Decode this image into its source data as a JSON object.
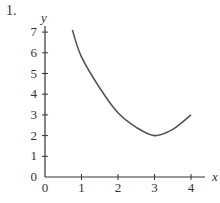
{
  "problem_number": "1.",
  "chart_data": {
    "type": "line",
    "title": "",
    "xlabel": "x",
    "ylabel": "y",
    "xlim": [
      0,
      4
    ],
    "ylim": [
      0,
      7
    ],
    "x_ticks": [
      0,
      1,
      2,
      3,
      4
    ],
    "y_ticks": [
      0,
      1,
      2,
      3,
      4,
      5,
      6,
      7
    ],
    "grid": false,
    "legend": null,
    "series": [
      {
        "name": "curve",
        "x": [
          0.75,
          1,
          1.5,
          2,
          2.5,
          3,
          3.5,
          4
        ],
        "y": [
          7.1,
          5.8,
          4.3,
          3.1,
          2.4,
          2.0,
          2.3,
          3.0
        ]
      }
    ],
    "annotations": [
      "minimum near (3, 2)"
    ]
  },
  "style": {
    "axis_color": "#333333",
    "curve_color": "#555555"
  }
}
